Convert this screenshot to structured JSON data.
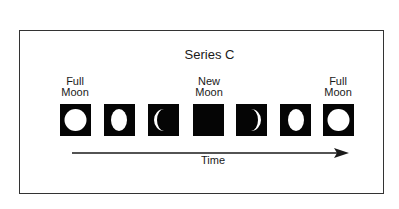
{
  "diagram": {
    "title": "Series C",
    "labels": {
      "first_full": [
        "Full",
        "Moon"
      ],
      "new": [
        "New",
        "Moon"
      ],
      "last_full": [
        "Full",
        "Moon"
      ]
    },
    "phases": [
      {
        "name": "full-moon",
        "illumination": "full"
      },
      {
        "name": "waning-gibbous",
        "illumination": "gibbous"
      },
      {
        "name": "waning-crescent",
        "illumination": "crescent-left"
      },
      {
        "name": "new-moon",
        "illumination": "none"
      },
      {
        "name": "waxing-crescent",
        "illumination": "crescent-right"
      },
      {
        "name": "waxing-gibbous",
        "illumination": "gibbous"
      },
      {
        "name": "full-moon",
        "illumination": "full"
      }
    ],
    "axis_label": "Time",
    "colors": {
      "box": "#050505",
      "moon": "#ffffff",
      "line": "#1a1a1a",
      "frame": "#333333"
    }
  }
}
